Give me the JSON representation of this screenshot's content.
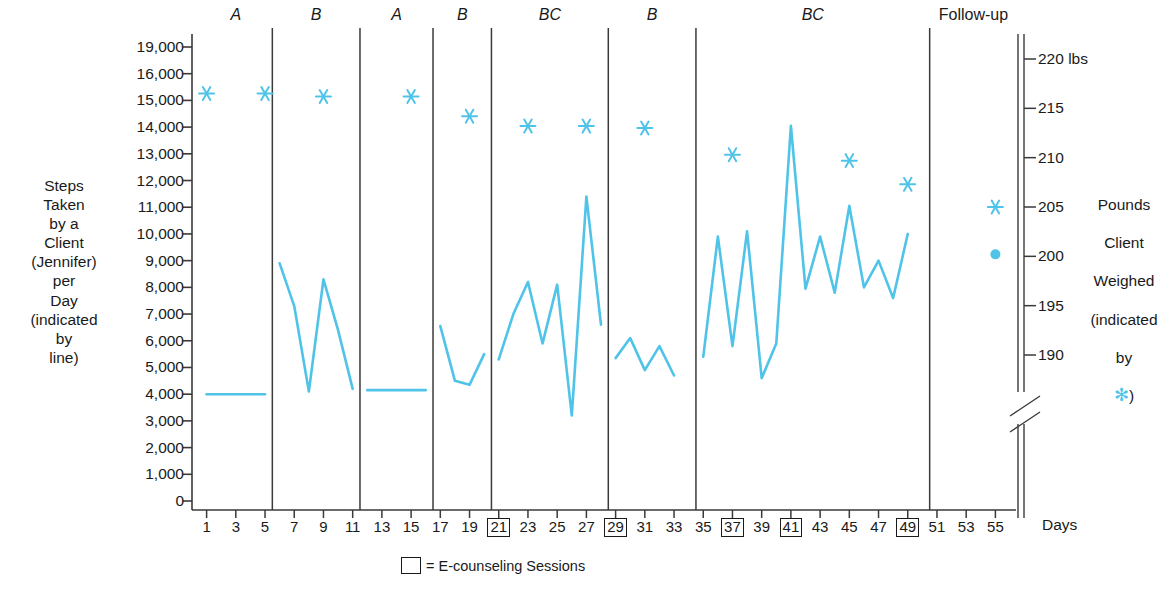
{
  "colors": {
    "line": "#4FC3E8",
    "marker": "#4FC3E8",
    "axis": "#3a3a3a",
    "text": "#1a1a1a"
  },
  "axes": {
    "left_title": "Steps\nTaken\nby a\nClient\n(Jennifer)\nper\nDay\n(indicated\nby\nline)",
    "right_title_line1": "Pounds",
    "right_title_line2": "Client",
    "right_title_line3": "Weighed",
    "right_title_line4": "(indicated",
    "right_title_line5": "by",
    "right_title_star": "✻",
    "right_title_close": ")",
    "x_axis_name": "Days",
    "right_unit_label": "220 lbs",
    "left_ticks": [
      "19,000",
      "16,000",
      "15,000",
      "14,000",
      "13,000",
      "12,000",
      "11,000",
      "10,000",
      "9,000",
      "8,000",
      "7,000",
      "6,000",
      "5,000",
      "4,000",
      "3,000",
      "2,000",
      "1,000",
      "0"
    ],
    "right_ticks": [
      "220 lbs",
      "215",
      "210",
      "205",
      "200",
      "195",
      "190"
    ],
    "x_ticks": [
      "1",
      "3",
      "5",
      "7",
      "9",
      "11",
      "13",
      "15",
      "17",
      "19",
      "21",
      "23",
      "25",
      "27",
      "29",
      "31",
      "33",
      "35",
      "37",
      "39",
      "41",
      "43",
      "45",
      "47",
      "49",
      "51",
      "53",
      "55"
    ],
    "x_ticks_boxed": [
      "21",
      "29",
      "37",
      "41",
      "49"
    ]
  },
  "legend": {
    "symbol_label": "□",
    "text": "= E-counseling Sessions"
  },
  "chart_data": {
    "type": "line",
    "title": "",
    "xlabel": "Days",
    "ylabel": "Steps Taken by a Client (Jennifer) per Day (indicated by line)",
    "y2label": "Pounds Client Weighed (indicated by *)",
    "xlim": [
      0,
      56
    ],
    "ylim": [
      0,
      19000
    ],
    "y2lim": [
      188,
      221
    ],
    "grid": false,
    "legend_position": "bottom-center",
    "y_tick_values": [
      0,
      1000,
      2000,
      3000,
      4000,
      5000,
      6000,
      7000,
      8000,
      9000,
      10000,
      11000,
      12000,
      13000,
      14000,
      15000,
      16000,
      19000
    ],
    "y2_tick_values": [
      190,
      195,
      200,
      205,
      210,
      215,
      220
    ],
    "x_tick_values": [
      1,
      3,
      5,
      7,
      9,
      11,
      13,
      15,
      17,
      19,
      21,
      23,
      25,
      27,
      29,
      31,
      33,
      35,
      37,
      39,
      41,
      43,
      45,
      47,
      49,
      51,
      53,
      55
    ],
    "ecounseling_days": [
      21,
      29,
      37,
      41,
      49
    ],
    "phases": [
      {
        "label": "A",
        "start_day": 1,
        "end_day": 5,
        "italic": true
      },
      {
        "label": "B",
        "start_day": 6,
        "end_day": 11,
        "italic": true
      },
      {
        "label": "A",
        "start_day": 12,
        "end_day": 16,
        "italic": true
      },
      {
        "label": "B",
        "start_day": 17,
        "end_day": 20,
        "italic": true
      },
      {
        "label": "BC",
        "start_day": 21,
        "end_day": 28,
        "italic": true
      },
      {
        "label": "B",
        "start_day": 29,
        "end_day": 34,
        "italic": true
      },
      {
        "label": "BC",
        "start_day": 35,
        "end_day": 50,
        "italic": true
      },
      {
        "label": "Follow-up",
        "start_day": 51,
        "end_day": 56,
        "italic": false
      }
    ],
    "phase_dividers": [
      5.5,
      11.5,
      16.5,
      20.5,
      28.5,
      34.5,
      50.5
    ],
    "series": [
      {
        "name": "Steps per Day",
        "axis": "left",
        "style": "line",
        "segments": [
          {
            "phase": "A",
            "x": [
              1,
              2,
              3,
              4,
              5
            ],
            "y": [
              4000,
              4000,
              4000,
              4000,
              4000
            ]
          },
          {
            "phase": "B",
            "x": [
              6,
              7,
              8,
              9,
              10,
              11
            ],
            "y": [
              8900,
              7300,
              4100,
              8300,
              6400,
              4200
            ]
          },
          {
            "phase": "A",
            "x": [
              12,
              13,
              14,
              15,
              16
            ],
            "y": [
              4150,
              4150,
              4150,
              4150,
              4150
            ]
          },
          {
            "phase": "B",
            "x": [
              17,
              18,
              19,
              20
            ],
            "y": [
              6550,
              4500,
              4350,
              5500
            ]
          },
          {
            "phase": "BC",
            "x": [
              21,
              22,
              23,
              24,
              25,
              26,
              27,
              28
            ],
            "y": [
              5300,
              7000,
              8200,
              5900,
              8100,
              3200,
              11400,
              6600
            ]
          },
          {
            "phase": "B",
            "x": [
              29,
              30,
              31,
              32,
              33
            ],
            "y": [
              5350,
              6100,
              4900,
              5800,
              4700
            ]
          },
          {
            "phase": "BC",
            "x": [
              35,
              36,
              37,
              38,
              39,
              40,
              41,
              42,
              43,
              44,
              45,
              46,
              47,
              48,
              49
            ],
            "y": [
              5400,
              9900,
              5800,
              10100,
              4600,
              5900,
              14050,
              7950,
              9900,
              7800,
              11050,
              8000,
              9000,
              7600,
              10000
            ]
          }
        ]
      },
      {
        "name": "Weight (lbs)",
        "axis": "right",
        "style": "marker-asterisk",
        "points": [
          {
            "day": 1,
            "lbs": 216.5
          },
          {
            "day": 5,
            "lbs": 216.5
          },
          {
            "day": 9,
            "lbs": 216.2
          },
          {
            "day": 15,
            "lbs": 216.2
          },
          {
            "day": 19,
            "lbs": 214.2
          },
          {
            "day": 23,
            "lbs": 213.2
          },
          {
            "day": 27,
            "lbs": 213.2
          },
          {
            "day": 31,
            "lbs": 213.0
          },
          {
            "day": 37,
            "lbs": 210.3
          },
          {
            "day": 45,
            "lbs": 209.7
          },
          {
            "day": 49,
            "lbs": 207.3
          },
          {
            "day": 55,
            "lbs": 205.0
          }
        ]
      },
      {
        "name": "Follow-up Weight Point",
        "axis": "right",
        "style": "marker-dot",
        "points": [
          {
            "day": 55,
            "lbs": 200.2
          }
        ]
      }
    ]
  }
}
